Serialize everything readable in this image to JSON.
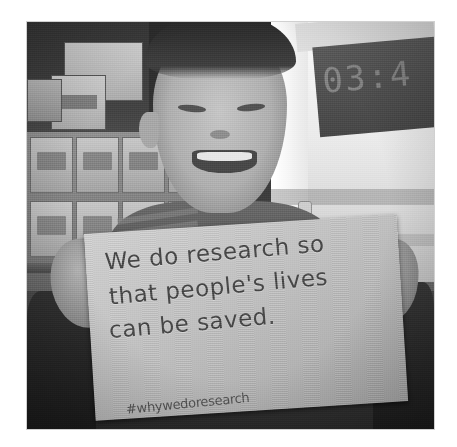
{
  "photo": {
    "alt_description": "Black and white photograph of a smiling young child holding a handwritten sign",
    "subject": "young child smiling and holding a handwritten sign",
    "setting": "classroom or research lab with wall posters, labelled storage boxes and a white cabinet"
  },
  "sign": {
    "lines": [
      "We do research so",
      "that people's lives",
      "can be saved."
    ],
    "line1": "We do research so",
    "line2": "that people's lives",
    "line3": "can be saved.",
    "hashtag": "#whywedoresearch"
  },
  "background": {
    "display_digits": "03:4",
    "poster_count": 3,
    "box_row_count": 2
  },
  "colors": {
    "page_background": "#ffffff",
    "photo_mid_gray": "#8a8a8a",
    "sign_paper": "#c2c0ba",
    "sign_ink": "#4b4741",
    "wall_dark": "#3b3b3b",
    "cabinet_white": "#f2f2f2",
    "display_panel": "#4a4a4a"
  }
}
